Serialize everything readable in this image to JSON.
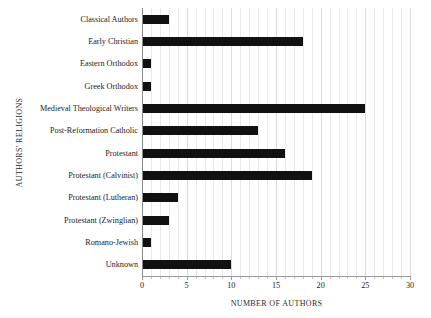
{
  "chart_data": {
    "type": "bar",
    "orientation": "horizontal",
    "title": "",
    "xlabel": "NUMBER OF AUTHORS",
    "ylabel": "AUTHORS' RELIGIONS",
    "categories": [
      "Classical Authors",
      "Early Christian",
      "Eastern Orthodox",
      "Greek Orthodox",
      "Medieval Theological Writers",
      "Post-Reformation Catholic",
      "Protestant",
      "Protestant (Calvinist)",
      "Protestant (Lutheran)",
      "Protestant (Zwinglian)",
      "Romano-Jewish",
      "Unknown"
    ],
    "values": [
      3,
      18,
      1,
      1,
      25,
      13,
      16,
      19,
      4,
      3,
      1,
      10
    ],
    "xlim": [
      0,
      30
    ],
    "xticks": [
      0,
      5,
      10,
      15,
      20,
      25,
      30
    ],
    "xtick_labels": [
      "0",
      "5",
      "10",
      "15",
      "20",
      "25",
      "30"
    ],
    "minor_tick_step": 1,
    "grid": "vertical",
    "legend": "none",
    "bar_color": "#111111",
    "grid_color": "#e8e8e8",
    "axis_color": "#8a8a8a"
  }
}
